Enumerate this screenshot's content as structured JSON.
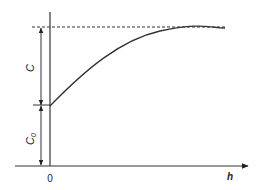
{
  "diagram": {
    "type": "saturation-curve",
    "colors": {
      "stroke": "#333333",
      "text": "#222222",
      "background": "#ffffff"
    },
    "axes": {
      "x_label": "h",
      "origin_label": "0"
    },
    "dimensions": {
      "upper_label": "C",
      "lower_label": "C",
      "lower_subscript": "0"
    },
    "asymptote": {
      "style": "dashed"
    }
  }
}
